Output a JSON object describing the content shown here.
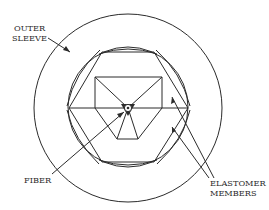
{
  "figure": {
    "type": "cross-section diagram",
    "labels": {
      "outer_sleeve_line1": "OUTER",
      "outer_sleeve_line2": "SLEEVE",
      "fiber": "FIBER",
      "elastomer_line1": "ELASTOMER",
      "elastomer_line2": "MEMBERS"
    },
    "colors": {
      "line": "#2b2b2b",
      "background": "#ffffff"
    }
  }
}
